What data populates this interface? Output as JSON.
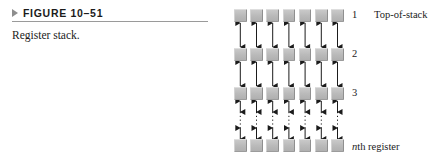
{
  "figure": {
    "marker_icon": "triangle-right-icon",
    "number_label": "FIGURE 10–51",
    "caption": "Register stack."
  },
  "diagram": {
    "title": "Register stack",
    "columns": 7,
    "rows": [
      {
        "id": "row-1",
        "label": "1",
        "note": "Top-of-stack"
      },
      {
        "id": "row-2",
        "label": "2",
        "note": ""
      },
      {
        "id": "row-3",
        "label": "3",
        "note": ""
      },
      {
        "id": "row-n",
        "label": "",
        "note": "nth register",
        "note_italic_prefix": "n",
        "note_rest": "th register"
      }
    ],
    "connector_style_solid": "double-headed-arrow",
    "connector_style_dotted": "dotted-continuation",
    "colors": {
      "box_fill": "#bdbdbd",
      "box_shadow": "#9c9c9c",
      "rule": "#9a9a9a",
      "marker": "#8e8e8e",
      "text": "#1b1b1b",
      "arrow": "#1b1b1b"
    }
  }
}
